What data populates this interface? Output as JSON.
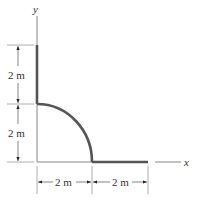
{
  "figure": {
    "axes": {
      "x_label": "x",
      "y_label": "y"
    },
    "dimensions": {
      "vertical_upper": "2 m",
      "vertical_lower": "2 m",
      "horizontal_left": "2 m",
      "horizontal_right": "2 m"
    },
    "shape": {
      "description": "Thin rod: vertical segment 2 m along y-axis from y=4 to y=2, quarter-circle arc of radius 2 m from (0,2) to (2,0), then horizontal segment 2 m along x-axis from x=2 to x=4",
      "segments": [
        {
          "type": "line",
          "from": [
            0,
            4
          ],
          "to": [
            0,
            2
          ],
          "length": "2 m"
        },
        {
          "type": "arc",
          "center": [
            0,
            0
          ],
          "radius": "2 m",
          "from": [
            0,
            2
          ],
          "to": [
            2,
            0
          ]
        },
        {
          "type": "line",
          "from": [
            2,
            0
          ],
          "to": [
            4,
            0
          ],
          "length": "2 m"
        }
      ]
    },
    "colors": {
      "rod": "#555555",
      "thin_lines": "#888888",
      "text": "#333333"
    }
  }
}
